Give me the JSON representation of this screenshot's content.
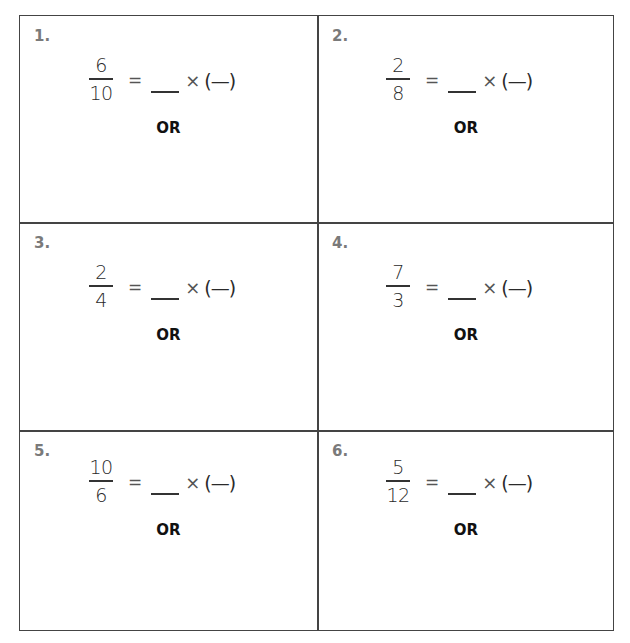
{
  "worksheet": {
    "problems": [
      {
        "label": "1.",
        "numerator": "6",
        "denominator": "10",
        "equals": "=",
        "times": "×",
        "paren_blank": "(—)",
        "or_label": "OR"
      },
      {
        "label": "2.",
        "numerator": "2",
        "denominator": "8",
        "equals": "=",
        "times": "×",
        "paren_blank": "(—)",
        "or_label": "OR"
      },
      {
        "label": "3.",
        "numerator": "2",
        "denominator": "4",
        "equals": "=",
        "times": "×",
        "paren_blank": "(—)",
        "or_label": "OR"
      },
      {
        "label": "4.",
        "numerator": "7",
        "denominator": "3",
        "equals": "=",
        "times": "×",
        "paren_blank": "(—)",
        "or_label": "OR"
      },
      {
        "label": "5.",
        "numerator": "10",
        "denominator": "6",
        "equals": "=",
        "times": "×",
        "paren_blank": "(—)",
        "or_label": "OR"
      },
      {
        "label": "6.",
        "numerator": "5",
        "denominator": "12",
        "equals": "=",
        "times": "×",
        "paren_blank": "(—)",
        "or_label": "OR"
      }
    ]
  },
  "colors": {
    "grid_line": "#444444",
    "label_gray": "#7a7a7a",
    "text": "#222222",
    "background": "#ffffff"
  }
}
